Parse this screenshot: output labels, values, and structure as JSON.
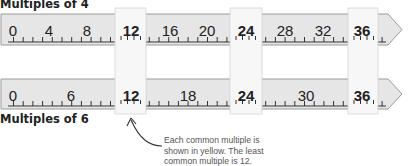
{
  "rulers": [
    {
      "title": "Multiples of 4",
      "step": 4,
      "labels": [
        "0",
        "4",
        "8",
        "12",
        "16",
        "20",
        "24",
        "28",
        "32",
        "36"
      ],
      "label_x": [
        13,
        49,
        87,
        131,
        170,
        207,
        246,
        285,
        323,
        362
      ]
    },
    {
      "title": "Multiples of 6",
      "step": 6,
      "labels": [
        "0",
        "6",
        "12",
        "18",
        "24",
        "30",
        "36"
      ],
      "label_x": [
        13,
        71,
        131,
        188,
        246,
        306,
        362
      ]
    }
  ],
  "common_multiples": [
    "12",
    "24",
    "36"
  ],
  "annotation": {
    "line1": "Each common multiple is",
    "line2": "shown in yellow. The least",
    "line3": "common multiple is 12."
  },
  "colors": {
    "ruler_fill": "#e6e6e6",
    "ruler_stroke": "#9a9a9a",
    "highlight_fill": "#f7f7f7",
    "text": "#222222"
  }
}
